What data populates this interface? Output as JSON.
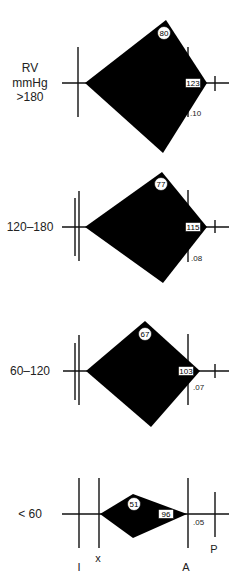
{
  "figure": {
    "panels": [
      {
        "group_label_lines": [
          "RV",
          "mmHg",
          ">180"
        ],
        "peak_value": "80",
        "end_value": "123",
        "duration_label": ".10"
      },
      {
        "group_label_lines": [
          "120–180"
        ],
        "peak_value": "77",
        "end_value": "115",
        "duration_label": ".08"
      },
      {
        "group_label_lines": [
          "60–120"
        ],
        "peak_value": "67",
        "end_value": "103",
        "duration_label": ".07"
      },
      {
        "group_label_lines": [
          "< 60"
        ],
        "peak_value": "51",
        "end_value": "96",
        "duration_label": ".05"
      }
    ],
    "axis_markers": {
      "I": "I",
      "X": "x",
      "A": "A",
      "P": "P"
    }
  }
}
